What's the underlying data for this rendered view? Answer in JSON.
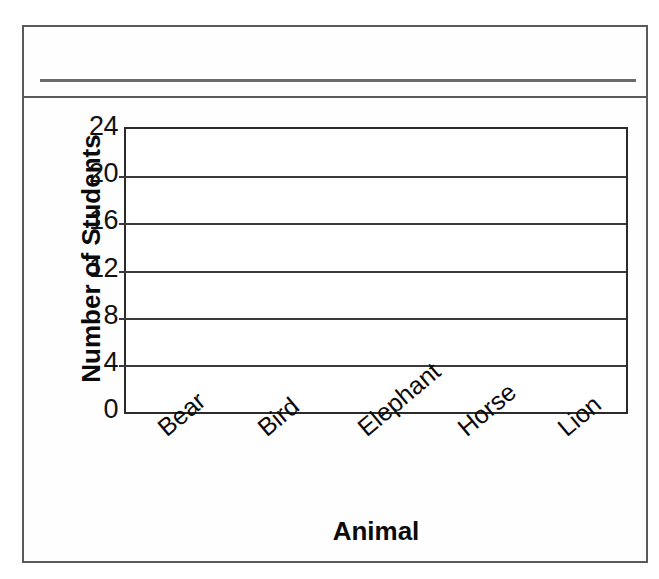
{
  "worksheet": {
    "title": "",
    "title_placeholder": "",
    "has_write_in_rule": true
  },
  "chart_data": {
    "type": "bar",
    "title": "",
    "xlabel": "Animal",
    "ylabel": "Number of Students",
    "categories": [
      "Bear",
      "Bird",
      "Elephant",
      "Horse",
      "Lion"
    ],
    "values": [
      null,
      null,
      null,
      null,
      null
    ],
    "ylim": [
      0,
      24
    ],
    "ytick_labels": [
      "0",
      "4",
      "8",
      "12",
      "16",
      "20",
      "24"
    ],
    "ytick_values": [
      0,
      4,
      8,
      12,
      16,
      20,
      24
    ],
    "ytick_step": 4,
    "grid": true,
    "grid_axis": "y",
    "legend": false,
    "legend_position": "none",
    "xtick_label_rotation": -40,
    "note": "blank grid — no bars plotted"
  },
  "style": {
    "frame_color": "#5a5a5a",
    "axis_color": "#2b2b2b",
    "grid_color": "#3a3a3a",
    "text_color": "#0a0a0a",
    "paper_color": "#ffffff"
  }
}
